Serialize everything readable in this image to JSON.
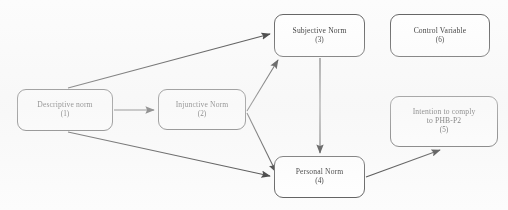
{
  "diagram": {
    "background_color": "#fcfcfc",
    "line_color": "#3a3a3a",
    "box_border_color": "#5b5b5b",
    "box_fill_color": "#ffffff",
    "nodes": [
      {
        "id": "descriptive-norm",
        "label": "Descriptive norm",
        "index": "(1)"
      },
      {
        "id": "injunctive-norm",
        "label": "Injunctive Norm",
        "index": "(2)"
      },
      {
        "id": "subjective-norm",
        "label": "Subjective Norm",
        "index": "(3)"
      },
      {
        "id": "personal-norm",
        "label": "Personal Norm",
        "index": "(4)"
      },
      {
        "id": "intention",
        "label": "Intention to comply\nto PHB-P2",
        "index": "(5)"
      },
      {
        "id": "control-variable",
        "label": "Control Variable",
        "index": "(6)"
      }
    ],
    "edges": [
      {
        "id": "descriptive-to-subjective",
        "from": "descriptive-norm",
        "to": "subjective-norm",
        "style": "solid",
        "arrow": "single"
      },
      {
        "id": "descriptive-to-injunctive",
        "from": "descriptive-norm",
        "to": "injunctive-norm",
        "style": "solid",
        "arrow": "single"
      },
      {
        "id": "descriptive-to-personal",
        "from": "descriptive-norm",
        "to": "personal-norm",
        "style": "solid",
        "arrow": "single"
      },
      {
        "id": "injunctive-to-subjective",
        "from": "injunctive-norm",
        "to": "subjective-norm",
        "style": "solid",
        "arrow": "single"
      },
      {
        "id": "injunctive-to-personal",
        "from": "injunctive-norm",
        "to": "personal-norm",
        "style": "solid",
        "arrow": "single"
      },
      {
        "id": "subjective-to-personal",
        "from": "subjective-norm",
        "to": "personal-norm",
        "style": "solid",
        "arrow": "single"
      },
      {
        "id": "personal-to-intention",
        "from": "personal-norm",
        "to": "intention",
        "style": "solid",
        "arrow": "single"
      }
    ]
  }
}
